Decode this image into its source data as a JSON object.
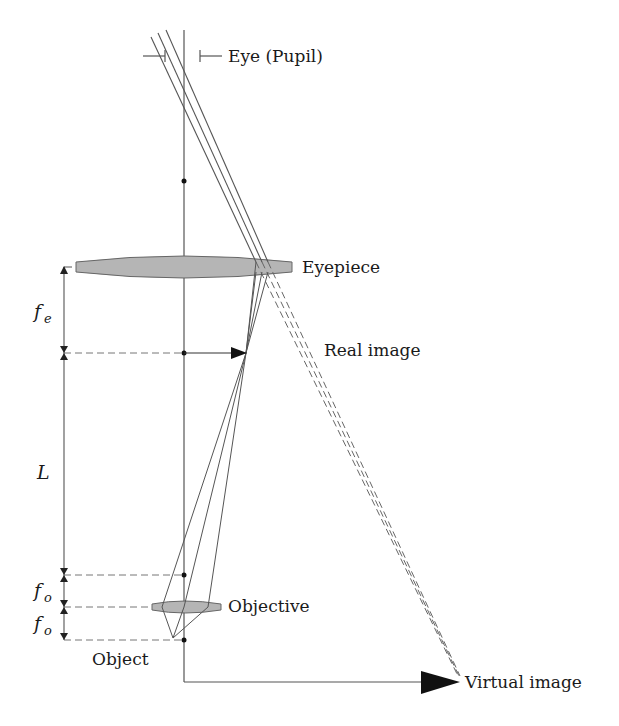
{
  "diagram": {
    "colors": {
      "line": "#555555",
      "lens_fill": "#b5b5b5",
      "arrow": "#111111",
      "text": "#1a1a1a"
    },
    "labels": {
      "eye": "Eye (Pupil)",
      "eyepiece": "Eyepiece",
      "real_image": "Real image",
      "objective": "Objective",
      "object": "Object",
      "virtual_image": "Virtual image"
    },
    "dimensions": {
      "fe": {
        "symbol": "f",
        "subscript": "e"
      },
      "L": {
        "symbol": "L"
      },
      "fo_upper": {
        "symbol": "f",
        "subscript": "o"
      },
      "fo_lower": {
        "symbol": "f",
        "subscript": "o"
      }
    }
  }
}
